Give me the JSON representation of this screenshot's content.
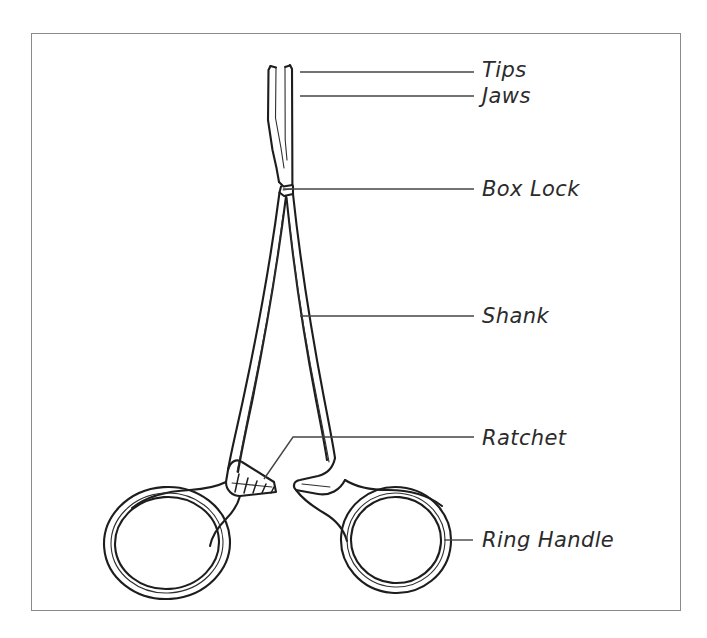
{
  "figure": {
    "kind": "labeled-anatomy-diagram",
    "frame": {
      "border_color": "#8a8a8a",
      "background_color": "#ffffff",
      "x": 31,
      "y": 33,
      "width": 650,
      "height": 578
    },
    "drawing": {
      "line_color": "#1d1d1d",
      "inner_line_color": "#2e2e2e",
      "fill": "none"
    },
    "leader_color": "#444444",
    "label_color": "#2b2b2b",
    "callouts": [
      {
        "id": "tips",
        "label": "Tips",
        "label_x": 482,
        "label_y": 60,
        "leader": "M 300 72 L 474 72",
        "anchor": "upper blade ends"
      },
      {
        "id": "jaws",
        "label": "Jaws",
        "label_x": 482,
        "label_y": 86,
        "leader": "M 300 96 L 474 96",
        "anchor": "serrated gripping blades"
      },
      {
        "id": "box-lock",
        "label": "Box Lock",
        "label_x": 482,
        "label_y": 179,
        "leader": "M 283 189 L 474 189",
        "anchor": "pivot joint"
      },
      {
        "id": "shank",
        "label": "Shank",
        "label_x": 482,
        "label_y": 306,
        "leader": "M 300 316 L 474 316",
        "anchor": "long arm between box lock and ratchet"
      },
      {
        "id": "ratchet",
        "label": "Ratchet",
        "label_x": 482,
        "label_y": 428,
        "leader": "M 264 479 L 293 437 L 474 437",
        "anchor": "locking teeth"
      },
      {
        "id": "ring-handle",
        "label": "Ring Handle",
        "label_x": 482,
        "label_y": 530,
        "leader": "M 444 540 L 473 540",
        "anchor": "finger ring"
      }
    ]
  }
}
